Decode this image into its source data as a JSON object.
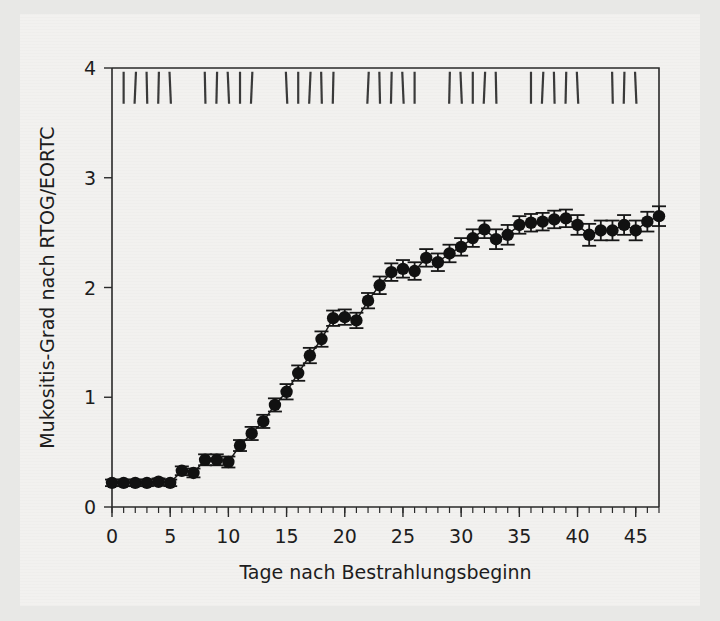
{
  "figure": {
    "background_color": "#f2f1ef",
    "page_background_color": "#e8e8e6",
    "ink_color": "#171717"
  },
  "chart_data": {
    "type": "scatter",
    "title": "",
    "subtitle": "",
    "xlabel": "Tage nach Bestrahlungsbeginn",
    "ylabel": "Mukositis-Grad nach RTOG/EORTC",
    "xlim": [
      0,
      47
    ],
    "ylim": [
      0,
      4
    ],
    "xticks": [
      0,
      5,
      10,
      15,
      20,
      25,
      30,
      35,
      40,
      45
    ],
    "xticklabels": [
      "0",
      "5",
      "10",
      "15",
      "20",
      "25",
      "30",
      "35",
      "40",
      "45"
    ],
    "yticks": [
      0,
      1,
      2,
      3,
      4
    ],
    "yticklabels": [
      "0",
      "1",
      "2",
      "3",
      "4"
    ],
    "x_minor_tick_step": 1,
    "grid": false,
    "legend": null,
    "marker": "filled-circle",
    "error_bars": "symmetric-vertical",
    "series": [
      {
        "name": "Mukositis-Grad (Mittelwert +/- SEM)",
        "x": [
          0,
          1,
          2,
          3,
          4,
          5,
          6,
          7,
          8,
          9,
          10,
          11,
          12,
          13,
          14,
          15,
          16,
          17,
          18,
          19,
          20,
          21,
          22,
          23,
          24,
          25,
          26,
          27,
          28,
          29,
          30,
          31,
          32,
          33,
          34,
          35,
          36,
          37,
          38,
          39,
          40,
          41,
          42,
          43,
          44,
          45,
          46,
          47
        ],
        "values": [
          0.22,
          0.22,
          0.22,
          0.22,
          0.23,
          0.22,
          0.33,
          0.31,
          0.43,
          0.43,
          0.41,
          0.56,
          0.67,
          0.78,
          0.93,
          1.05,
          1.22,
          1.38,
          1.53,
          1.72,
          1.73,
          1.7,
          1.88,
          2.02,
          2.14,
          2.17,
          2.15,
          2.27,
          2.23,
          2.31,
          2.37,
          2.45,
          2.53,
          2.44,
          2.48,
          2.57,
          2.59,
          2.6,
          2.62,
          2.63,
          2.57,
          2.48,
          2.52,
          2.52,
          2.57,
          2.52,
          2.6,
          2.65
        ],
        "errors": [
          0.03,
          0.03,
          0.03,
          0.03,
          0.03,
          0.03,
          0.04,
          0.04,
          0.05,
          0.05,
          0.05,
          0.05,
          0.06,
          0.06,
          0.06,
          0.07,
          0.07,
          0.07,
          0.07,
          0.07,
          0.07,
          0.07,
          0.07,
          0.08,
          0.08,
          0.08,
          0.08,
          0.08,
          0.08,
          0.08,
          0.08,
          0.08,
          0.08,
          0.09,
          0.09,
          0.08,
          0.08,
          0.08,
          0.08,
          0.08,
          0.09,
          0.1,
          0.09,
          0.09,
          0.09,
          0.09,
          0.09,
          0.09
        ]
      }
    ],
    "annotations": {
      "radiation_fraction_marks": {
        "description": "Vertical tick marks at top of plot indicating radiotherapy fractions",
        "y_value": 3.82,
        "days": [
          1,
          2,
          3,
          4,
          5,
          8,
          9,
          10,
          11,
          12,
          15,
          16,
          17,
          18,
          19,
          22,
          23,
          24,
          25,
          26,
          29,
          30,
          31,
          32,
          33,
          36,
          37,
          38,
          39,
          40,
          43,
          44,
          45
        ]
      }
    }
  }
}
